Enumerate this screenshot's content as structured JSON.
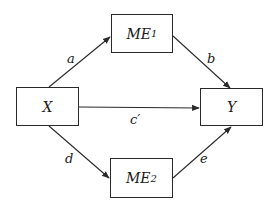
{
  "diagram": {
    "type": "mediation-path-diagram",
    "nodes": {
      "x": {
        "label": "X"
      },
      "y": {
        "label": "Y"
      },
      "me1": {
        "label": "ME",
        "sub": "1"
      },
      "me2": {
        "label": "ME",
        "sub": "2"
      }
    },
    "edges": [
      {
        "from": "X",
        "to": "ME1",
        "label": "a"
      },
      {
        "from": "ME1",
        "to": "Y",
        "label": "b"
      },
      {
        "from": "X",
        "to": "Y",
        "label": "c′"
      },
      {
        "from": "X",
        "to": "ME2",
        "label": "d"
      },
      {
        "from": "ME2",
        "to": "Y",
        "label": "e"
      }
    ],
    "colors": {
      "stroke": "#2a2a2a",
      "background": "#ffffff"
    }
  }
}
